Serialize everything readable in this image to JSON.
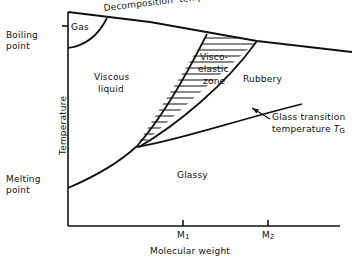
{
  "figure": {
    "type": "schematic-phase-diagram",
    "title": "",
    "axes": {
      "x": {
        "label": "Molecular weight",
        "ticks": [
          "M1",
          "M2"
        ],
        "tick_display": [
          "M",
          "M"
        ],
        "tick_subscripts": [
          "1",
          "2"
        ]
      },
      "y": {
        "label": "Temperature",
        "marks": [
          "Boiling point",
          "Melting point"
        ]
      }
    },
    "boundaries": [
      {
        "name": "decomposition-temperature",
        "label": "Decomposition temperature"
      },
      {
        "name": "glass-transition-temperature",
        "label": "Glass transition temperature TG"
      }
    ],
    "regions": [
      {
        "name": "gas",
        "label": "Gas"
      },
      {
        "name": "viscous-liquid",
        "label": "Viscous\nliquid"
      },
      {
        "name": "viscoelastic-zone",
        "label": "Visco-\nelastic\nzone",
        "hatched": true
      },
      {
        "name": "rubbery",
        "label": "Rubbery"
      },
      {
        "name": "glassy",
        "label": "Glassy"
      }
    ]
  },
  "labels": {
    "boiling_point": "Boiling\npoint",
    "melting_point": "Melting\npoint",
    "temperature_axis": "Temperature",
    "molecular_weight_axis": "Molecular weight",
    "decomposition": "Decomposition  temperature",
    "gas": "Gas",
    "viscous_liquid_line1": "Viscous",
    "viscous_liquid_line2": "liquid",
    "visco_line1": "Visco-",
    "visco_line2": "elastic",
    "visco_line3": "zone",
    "rubbery": "Rubbery",
    "glassy": "Glassy",
    "glass_transition_line1": "Glass transition",
    "glass_transition_line2_pre": "temperature ",
    "glass_transition_symbol": "T",
    "glass_transition_subscript": "G",
    "tick_m1_base": "M",
    "tick_m1_sub": "1",
    "tick_m2_base": "M",
    "tick_m2_sub": "2"
  },
  "colors": {
    "ink": "#111111",
    "background": "#ffffff"
  }
}
